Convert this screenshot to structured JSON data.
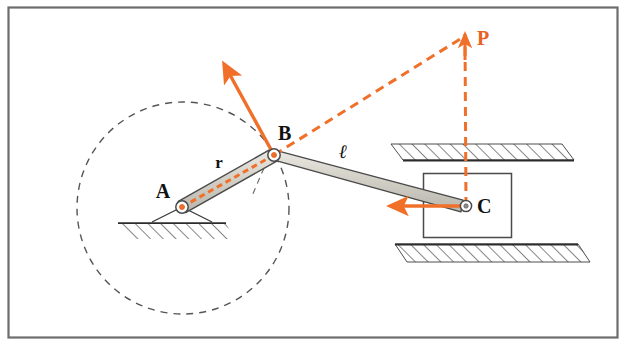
{
  "figure": {
    "kind": "slider-crank-mechanism-diagram",
    "frame": {
      "x": 8,
      "y": 7,
      "width": 610,
      "height": 331,
      "border_color": "#6d6d6d"
    },
    "background_color": "#ffffff",
    "colors": {
      "accent": "#f0702a",
      "accent_dark": "#e8631f",
      "link_fill": "#c9c6bd",
      "link_stroke": "#4a4a4a",
      "outline": "#333333",
      "dashed_gray": "#555555",
      "hatch": "#3a3a3a"
    },
    "labels": [
      {
        "name": "point-a",
        "text": "A",
        "x": 163,
        "y": 198,
        "style": "lbl-pt"
      },
      {
        "name": "point-b",
        "text": "B",
        "x": 278,
        "y": 140,
        "style": "lbl-pt"
      },
      {
        "name": "point-c",
        "text": "C",
        "x": 477,
        "y": 213,
        "style": "lbl-pt"
      },
      {
        "name": "point-p",
        "text": "P",
        "x": 477,
        "y": 45,
        "style": "lbl-pt-p"
      },
      {
        "name": "crank-length-r",
        "text": "r",
        "x": 219,
        "y": 168,
        "style": "lbl-dim"
      },
      {
        "name": "connecting-rod-length-l",
        "text": "ℓ",
        "x": 343,
        "y": 158,
        "style": "lbl-dim-script"
      }
    ],
    "geometry": {
      "pivot_a": {
        "x": 182,
        "y": 207,
        "r_outer": 6.5,
        "r_inner": 2.6
      },
      "pin_b": {
        "x": 274,
        "y": 155,
        "r_outer": 6.5,
        "r_inner": 2.6
      },
      "pin_c": {
        "x": 466,
        "y": 206,
        "r_outer": 6.0,
        "r_inner": 2.4
      },
      "point_p": {
        "x": 465,
        "y": 36
      },
      "crank_halfwidth": 6.5,
      "rod_halfwidth": 6.0,
      "path_circle": {
        "cx": 183,
        "cy": 208,
        "r": 106
      },
      "ground_a": {
        "x1": 118,
        "x2": 226,
        "y": 223
      },
      "slider_box": {
        "x": 423,
        "y": 173,
        "width": 89,
        "height": 65
      },
      "guide_top": {
        "x1": 403,
        "x2": 574,
        "y": 160
      },
      "guide_bottom": {
        "x1": 395,
        "x2": 578,
        "y": 244
      },
      "velocity_arrow_b": {
        "x1": 274,
        "y1": 155,
        "x2": 222,
        "y2": 60
      },
      "velocity_arrow_c": {
        "x1": 466,
        "y1": 206,
        "x2": 383,
        "y2": 206
      },
      "dashed_bp": {
        "x1": 274,
        "y1": 155,
        "x2": 465,
        "y2": 36
      },
      "dashed_cp": {
        "x1": 466,
        "y1": 206,
        "x2": 465,
        "y2": 36
      },
      "dashed_ab": {
        "x1": 182,
        "y1": 207,
        "x2": 274,
        "y2": 155
      }
    },
    "annotations": {
      "crank_label": "r",
      "rod_label": "ℓ",
      "instant_center_label": "P"
    }
  }
}
